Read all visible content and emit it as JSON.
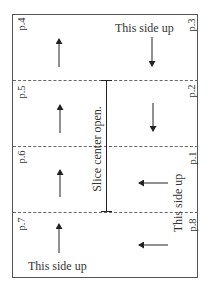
{
  "diagram": {
    "slice_label": "Slice center open.",
    "orientation_labels": {
      "top": "This side up",
      "right": "This side up",
      "bottom": "This side up"
    },
    "pages": {
      "p1": "p.1",
      "p2": "p.2",
      "p3": "p.3",
      "p4": "p.4",
      "p5": "p.5",
      "p6": "p.6",
      "p7": "p.7",
      "p8": "p.8"
    },
    "arrows": [
      {
        "panel": "p.4",
        "direction": "up"
      },
      {
        "panel": "p.3",
        "direction": "down"
      },
      {
        "panel": "p.5",
        "direction": "up"
      },
      {
        "panel": "p.2",
        "direction": "down"
      },
      {
        "panel": "p.6",
        "direction": "up"
      },
      {
        "panel": "p.1",
        "direction": "left"
      },
      {
        "panel": "p.7",
        "direction": "up"
      },
      {
        "panel": "p.8",
        "direction": "left"
      }
    ],
    "colors": {
      "line": "#222222",
      "frame": "#555555",
      "fold": "#666666"
    }
  }
}
